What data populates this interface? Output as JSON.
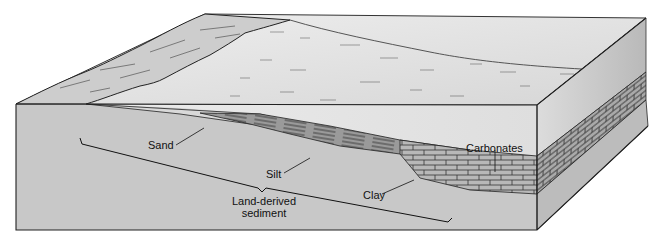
{
  "diagram": {
    "labels": {
      "sand": "Sand",
      "silt": "Silt",
      "clay": "Clay",
      "carbonates": "Carbonates",
      "land_derived_line1": "Land-derived",
      "land_derived_line2": "sediment"
    },
    "colors": {
      "background": "#ffffff",
      "ocean_surface": "#e4e4e4",
      "land": "#cfcfcf",
      "bedrock_speckle": "#bdbdbd",
      "sand_layer": "#d6d6d6",
      "silt_clay_layer": "#8a8a8a",
      "carbonate_layer": "#b5b5b5",
      "outline": "#222222"
    }
  }
}
